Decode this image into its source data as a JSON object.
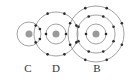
{
  "diagram": {
    "type": "atomic-structure",
    "colors": {
      "ring": "#8a8a8a",
      "electron": "#2a2a2a",
      "nucleus": "#9a9a9a",
      "label": "#333333"
    },
    "atoms": [
      {
        "label": "C",
        "cx": 29,
        "cy": 34,
        "shells": [
          {
            "r": 12,
            "electrons": 2
          }
        ]
      },
      {
        "label": "D",
        "cx": 56,
        "cy": 34,
        "shells": [
          {
            "r": 10,
            "electrons": 2
          },
          {
            "r": 22,
            "electrons": 8
          }
        ]
      },
      {
        "label": "B",
        "cx": 96,
        "cy": 34,
        "shells": [
          {
            "r": 10,
            "electrons": 2
          },
          {
            "r": 19,
            "electrons": 8
          },
          {
            "r": 28,
            "electrons": 8
          }
        ]
      }
    ]
  }
}
